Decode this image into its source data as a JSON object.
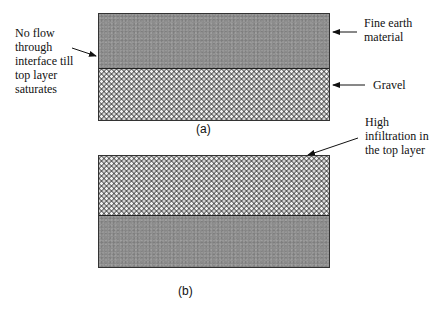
{
  "figure_a": {
    "caption": "(a)",
    "top_layer": "fine earth",
    "bottom_layer": "gravel",
    "annotations": {
      "left": "No flow\nthrough\ninterface till\ntop layer\nsaturates",
      "right_top": "Fine earth\nmaterial",
      "right_bottom": "Gravel"
    }
  },
  "figure_b": {
    "caption": "(b)",
    "top_layer": "gravel",
    "bottom_layer": "fine earth",
    "annotations": {
      "right_top": "High\ninfiltration in\nthe top layer"
    }
  }
}
